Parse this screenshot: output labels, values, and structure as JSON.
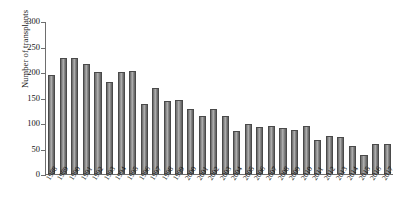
{
  "chart_data": {
    "type": "bar",
    "title": "",
    "xlabel": "",
    "ylabel": "Number of transplants",
    "ylim": [
      0,
      300
    ],
    "yticks": [
      0,
      50,
      100,
      150,
      200,
      250,
      300
    ],
    "grid": false,
    "legend": null,
    "bar_color": "#8c8c8c",
    "bar_edge_color": "#4a4a4a",
    "categories": [
      "1988",
      "1989",
      "1990",
      "1991",
      "1992",
      "1993",
      "1994",
      "1995",
      "1996",
      "1997",
      "1998",
      "1999",
      "2000",
      "2001",
      "2002",
      "2003",
      "2004",
      "2005",
      "2006",
      "2007",
      "2008",
      "2009",
      "2010",
      "2011",
      "2012",
      "2013",
      "2014",
      "2015",
      "2016",
      "2017"
    ],
    "values": [
      195,
      227,
      227,
      216,
      201,
      180,
      200,
      202,
      137,
      169,
      143,
      145,
      128,
      114,
      128,
      114,
      84,
      98,
      92,
      94,
      90,
      86,
      94,
      67,
      75,
      72,
      55,
      38,
      58,
      58
    ]
  }
}
